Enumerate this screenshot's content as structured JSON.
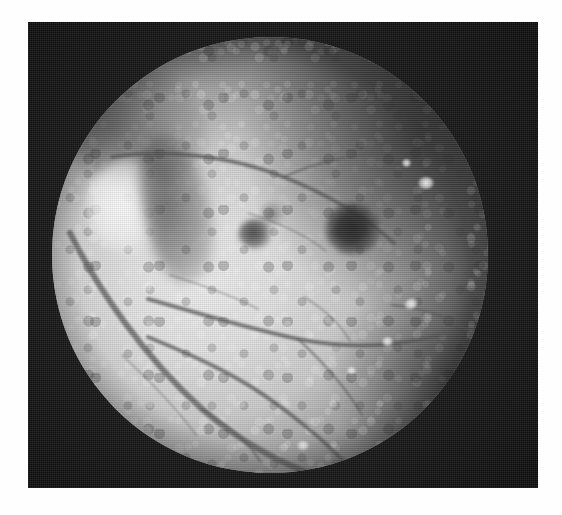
{
  "page": {
    "background_color": "#ffffff",
    "width": 562,
    "height": 515,
    "caption": ""
  },
  "plate": {
    "label": "fundus-photograph-plate",
    "background_color": "#161616",
    "left": 28,
    "top": 22,
    "width": 510,
    "height": 466
  },
  "fundus": {
    "label": "retinal fundus photograph",
    "modality": "grayscale fundus photography",
    "field_shape": "circle",
    "center_x": 276,
    "center_y": 253,
    "radius": 218,
    "base_color": "#c9c9c9",
    "rim_color": "#1a1a1a"
  },
  "features": [
    {
      "name": "optic-disc",
      "label": "Optic disc",
      "description": "bright pale oval, left of centre",
      "x": 100,
      "y": 185,
      "tone": "bright"
    },
    {
      "name": "disc-crescent",
      "label": "Peripapillary pigment crescent",
      "description": "dark crescent temporal to the disc",
      "x": 153,
      "y": 193,
      "tone": "dark"
    },
    {
      "name": "macula-lesion",
      "label": "Macular dark lesion",
      "description": "large round dark spot at the macula",
      "x": 346,
      "y": 238,
      "tone": "very dark"
    },
    {
      "name": "secondary-lesion",
      "label": "Secondary dark lesion",
      "description": "smaller dark spot nasal to the macula",
      "x": 254,
      "y": 249,
      "tone": "dark"
    },
    {
      "name": "mottled-region",
      "label": "Mottled pigmentary region",
      "description": "granular mottled texture, superior-temporal quadrant",
      "x": 385,
      "y": 130,
      "tone": "mixed"
    },
    {
      "name": "exudate-fleck",
      "label": "Bright exudate fleck",
      "description": "small white highlight",
      "x": 398,
      "y": 171,
      "tone": "bright"
    },
    {
      "name": "vascular-arcade",
      "label": "Retinal vascular arcade",
      "description": "branching dark vessels crossing the inferior and nasal retina",
      "x": 180,
      "y": 360,
      "tone": "dark"
    }
  ],
  "vessels": {
    "stroke_color": "#4a4a4a",
    "paths": [
      {
        "name": "inferior-arcade-main",
        "d": "M 18 196 C 46 252, 92 320, 150 372 C 192 408, 238 432, 286 446"
      },
      {
        "name": "inferior-arcade-branch-1",
        "d": "M 96 300 C 140 318, 186 338, 226 368 C 256 390, 282 412, 302 436"
      },
      {
        "name": "inferior-arcade-branch-2",
        "d": "M 150 372 C 176 388, 196 404, 208 424"
      },
      {
        "name": "superior-arcade-main",
        "d": "M 60 120 C 112 112, 176 118, 232 140 C 282 160, 316 182, 342 206"
      },
      {
        "name": "superior-branch-1",
        "d": "M 232 140 C 262 126, 296 118, 330 116"
      },
      {
        "name": "mid-horizontal-vessel",
        "d": "M 96 262 C 146 276, 198 292, 246 302 C 296 312, 348 310, 396 296"
      },
      {
        "name": "temporal-branch",
        "d": "M 246 302 C 272 326, 294 350, 310 378"
      },
      {
        "name": "nasal-fine-branch",
        "d": "M 118 238 C 150 248, 180 258, 206 272"
      },
      {
        "name": "peripheral-temporal",
        "d": "M 340 268 C 376 272, 404 282, 424 300"
      },
      {
        "name": "fine-branch-upper",
        "d": "M 196 176 C 228 186, 254 198, 274 214"
      },
      {
        "name": "fine-branch-lower-left",
        "d": "M 70 318 C 98 344, 124 370, 144 398"
      },
      {
        "name": "fine-branch-center",
        "d": "M 252 260 C 272 272, 288 286, 298 304"
      }
    ]
  }
}
